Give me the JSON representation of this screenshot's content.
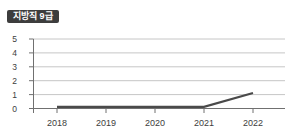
{
  "badge": {
    "label": "지방직 9급",
    "bg": "#3d3d3d",
    "fg": "#ffffff"
  },
  "chart_data": {
    "type": "line",
    "title": "지방직 9급",
    "categories": [
      "2018",
      "2019",
      "2020",
      "2021",
      "2022"
    ],
    "series": [
      {
        "name": "지방직 9급",
        "values": [
          0,
          0,
          0,
          0,
          1
        ]
      }
    ],
    "xlabel": "",
    "ylabel": "",
    "ylim": [
      0,
      5
    ],
    "yticks": [
      0,
      1,
      2,
      3,
      4,
      5
    ],
    "grid": true,
    "legend": "none",
    "colors": {
      "line": "#4a4a4a",
      "grid": "#c6c6c6",
      "axis": "#707070",
      "tick_label": "#3d3d3d"
    }
  }
}
